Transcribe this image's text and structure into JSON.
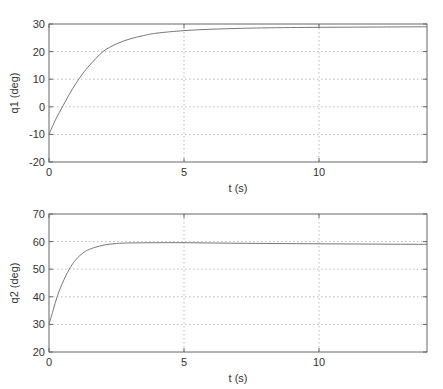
{
  "chart_data": [
    {
      "type": "line",
      "title": "",
      "xlabel": "t (s)",
      "ylabel": "q1 (deg)",
      "xlim": [
        0,
        14
      ],
      "ylim": [
        -20,
        30
      ],
      "xticks": [
        0,
        5,
        10
      ],
      "yticks": [
        -20,
        -10,
        0,
        10,
        20,
        30
      ],
      "grid": true,
      "series": [
        {
          "name": "q1",
          "x": [
            0,
            0.25,
            0.5,
            0.75,
            1.0,
            1.25,
            1.5,
            2.0,
            2.5,
            3.0,
            3.5,
            4.0,
            5.0,
            6.0,
            7.0,
            8.0,
            10.0,
            12.0,
            14.0
          ],
          "y": [
            -10,
            -4.5,
            0,
            4.5,
            8.5,
            12,
            15,
            20,
            22.8,
            24.6,
            25.8,
            26.7,
            27.6,
            28.1,
            28.4,
            28.6,
            28.8,
            28.9,
            29.0
          ]
        }
      ],
      "axes_box_px": {
        "left": 49,
        "top": 24,
        "right": 427,
        "bottom": 162
      }
    },
    {
      "type": "line",
      "title": "",
      "xlabel": "t (s)",
      "ylabel": "q2 (deg)",
      "xlim": [
        0,
        14
      ],
      "ylim": [
        20,
        70
      ],
      "xticks": [
        0,
        5,
        10
      ],
      "yticks": [
        20,
        30,
        40,
        50,
        60,
        70
      ],
      "grid": true,
      "series": [
        {
          "name": "q2",
          "x": [
            0,
            0.15,
            0.3,
            0.5,
            0.75,
            1.0,
            1.25,
            1.5,
            2.0,
            2.5,
            3.0,
            4.0,
            5.0,
            7.0,
            10.0,
            14.0
          ],
          "y": [
            30,
            35,
            40,
            45,
            50,
            53.5,
            55.8,
            57.2,
            58.7,
            59.3,
            59.5,
            59.6,
            59.6,
            59.4,
            59.2,
            59.0
          ]
        }
      ],
      "axes_box_px": {
        "left": 49,
        "top": 214,
        "right": 427,
        "bottom": 352
      }
    }
  ],
  "colors": {
    "axes": "#666666",
    "grid": "#bbbbbb",
    "line": "#777777",
    "text": "#333333"
  }
}
